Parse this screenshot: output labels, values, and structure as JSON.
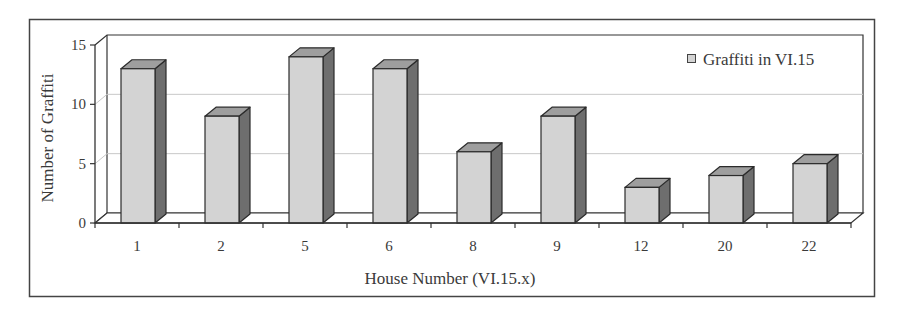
{
  "chart_data": {
    "type": "bar",
    "style": "3d-column",
    "title": "",
    "xlabel": "House Number (VI.15.x)",
    "ylabel": "Number of Graffiti",
    "categories": [
      "1",
      "2",
      "5",
      "6",
      "8",
      "9",
      "12",
      "20",
      "22"
    ],
    "series": [
      {
        "name": "Graffiti in VI.15",
        "values": [
          13,
          9,
          14,
          13,
          6,
          9,
          3,
          4,
          5
        ]
      }
    ],
    "ylim": [
      0,
      15
    ],
    "yticks": [
      0,
      5,
      10,
      15
    ],
    "grid": true,
    "legend_position": "top-right"
  },
  "colors": {
    "bar_front": "#d3d3d3",
    "bar_top": "#9e9e9e",
    "bar_side": "#6e6e6e",
    "bar_outline": "#2b2b2b",
    "gridline": "#c8c8c8",
    "axis": "#333333",
    "frame": "#444444"
  },
  "legend": {
    "label": "Graffiti in VI.15"
  },
  "axes": {
    "x_title": "House Number (VI.15.x)",
    "y_title": "Number of Graffiti"
  }
}
